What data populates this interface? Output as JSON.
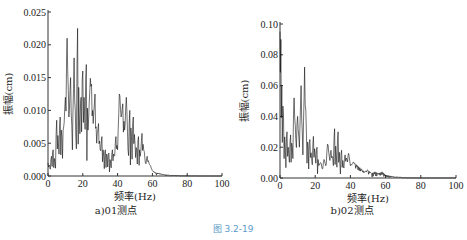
{
  "figure_caption": "图   3.2-19",
  "chart_data": [
    {
      "type": "line",
      "panel_caption": "a)01测点",
      "title": "",
      "xlabel": "频率(Hz)",
      "ylabel": "振幅(cm)",
      "xlim": [
        0,
        100
      ],
      "ylim": [
        0,
        0.025
      ],
      "xticks": [
        "0",
        "20",
        "40",
        "60",
        "80",
        "100"
      ],
      "yticks": [
        "0.000",
        "0.005",
        "0.010",
        "0.015",
        "0.020",
        "0.025"
      ],
      "grid": false,
      "series": [
        {
          "name": "01测点",
          "x": [
            0,
            1,
            2,
            3,
            4,
            5,
            6,
            7,
            8,
            9,
            10,
            11,
            12,
            13,
            14,
            15,
            16,
            17,
            18,
            19,
            20,
            21,
            22,
            23,
            24,
            25,
            26,
            27,
            28,
            29,
            30,
            31,
            32,
            33,
            34,
            35,
            36,
            37,
            38,
            39,
            40,
            41,
            42,
            43,
            44,
            45,
            46,
            47,
            48,
            49,
            50,
            51,
            52,
            53,
            54,
            55,
            56,
            57,
            58,
            59,
            60,
            62,
            64,
            66,
            68,
            70,
            75,
            80,
            90,
            100
          ],
          "y": [
            0.002,
            0.0015,
            0.003,
            0.004,
            0.002,
            0.0085,
            0.005,
            0.009,
            0.006,
            0.0075,
            0.012,
            0.021,
            0.009,
            0.015,
            0.004,
            0.018,
            0.006,
            0.0225,
            0.009,
            0.012,
            0.016,
            0.01,
            0.017,
            0.007,
            0.013,
            0.014,
            0.008,
            0.0125,
            0.005,
            0.008,
            0.004,
            0.006,
            0.003,
            0.004,
            0.003,
            0.0035,
            0.002,
            0.004,
            0.003,
            0.006,
            0.004,
            0.0125,
            0.009,
            0.011,
            0.007,
            0.012,
            0.004,
            0.01,
            0.006,
            0.009,
            0.005,
            0.004,
            0.006,
            0.003,
            0.0065,
            0.004,
            0.002,
            0.003,
            0.002,
            0.0015,
            0.0008,
            0.0005,
            0.0004,
            0.0003,
            0.0002,
            0.0001,
            5e-05,
            2e-05,
            0.0,
            0.0
          ]
        }
      ]
    },
    {
      "type": "line",
      "panel_caption": "b)02测点",
      "title": "",
      "xlabel": "频率(Hz)",
      "ylabel": "振幅(cm)",
      "xlim": [
        0,
        100
      ],
      "ylim": [
        0,
        0.1
      ],
      "xticks": [
        "0",
        "20",
        "40",
        "60",
        "80",
        "100"
      ],
      "yticks": [
        "0.00",
        "0.02",
        "0.04",
        "0.06",
        "0.08",
        "0.10"
      ],
      "grid": false,
      "series": [
        {
          "name": "02测点",
          "x": [
            0,
            0.5,
            1,
            2,
            3,
            4,
            5,
            6,
            7,
            8,
            9,
            10,
            11,
            12,
            13,
            14,
            15,
            16,
            17,
            18,
            19,
            20,
            21,
            22,
            23,
            24,
            25,
            26,
            27,
            28,
            29,
            30,
            31,
            32,
            33,
            34,
            35,
            36,
            37,
            38,
            39,
            40,
            42,
            44,
            46,
            48,
            50,
            52,
            54,
            56,
            58,
            60,
            62,
            64,
            66,
            68,
            70,
            80,
            90,
            100
          ],
          "y": [
            0.095,
            0.09,
            0.06,
            0.04,
            0.02,
            0.03,
            0.015,
            0.028,
            0.02,
            0.052,
            0.025,
            0.04,
            0.02,
            0.06,
            0.015,
            0.072,
            0.03,
            0.02,
            0.025,
            0.012,
            0.027,
            0.015,
            0.02,
            0.008,
            0.01,
            0.006,
            0.012,
            0.008,
            0.022,
            0.014,
            0.018,
            0.012,
            0.032,
            0.015,
            0.03,
            0.01,
            0.018,
            0.008,
            0.015,
            0.012,
            0.016,
            0.008,
            0.01,
            0.008,
            0.006,
            0.004,
            0.005,
            0.003,
            0.004,
            0.003,
            0.004,
            0.002,
            0.0015,
            0.001,
            0.0008,
            0.0005,
            0.0002,
            0.0,
            0.0,
            0.0
          ]
        }
      ]
    }
  ]
}
